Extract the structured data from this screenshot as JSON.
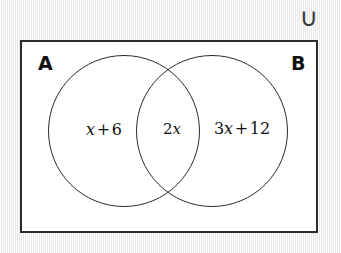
{
  "diagram": {
    "type": "venn-diagram",
    "universal_set_symbol": "∪",
    "set_labels": {
      "left": "A",
      "right": "B"
    },
    "regions": [
      {
        "id": "a-only",
        "name": "left-circle-only",
        "expression": "x + 6",
        "parts": {
          "coefficient": "",
          "variable": "x",
          "operator": "+",
          "constant": "6"
        }
      },
      {
        "id": "a-intersect-b",
        "name": "intersection",
        "expression": "2x",
        "parts": {
          "coefficient": "2",
          "variable": "x",
          "operator": "",
          "constant": ""
        }
      },
      {
        "id": "b-only",
        "name": "right-circle-only",
        "expression": "3x + 12",
        "parts": {
          "coefficient": "3",
          "variable": "x",
          "operator": "+",
          "constant": "12"
        }
      }
    ],
    "colors": {
      "stroke": "#2b2b2b",
      "text": "#111111",
      "box_fill": "#ffffff",
      "page_background": "#e9e9e9"
    }
  }
}
